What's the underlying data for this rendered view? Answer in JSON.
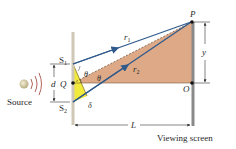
{
  "figure": {
    "labels": {
      "source": "Source",
      "slit1": "S",
      "slit1_sub": "1",
      "slit2": "S",
      "slit2_sub": "2",
      "midpoint": "Q",
      "separation": "d",
      "point_p": "P",
      "point_o": "O",
      "ray1": "r",
      "ray1_sub": "1",
      "ray2": "r",
      "ray2_sub": "2",
      "angle_upper": "θ",
      "angle_lower": "θ",
      "path_difference": "δ",
      "distance": "L",
      "height": "y",
      "screen": "Viewing screen"
    },
    "colors": {
      "ray": "#2f5a8c",
      "triangle_fill": "#d9a07a",
      "path_triangle_fill": "#f2ea3a",
      "barrier": "#cfc8b6",
      "screen": "#8a8a8a",
      "wave": "#b0655a",
      "source": "#d8cfa8"
    }
  }
}
